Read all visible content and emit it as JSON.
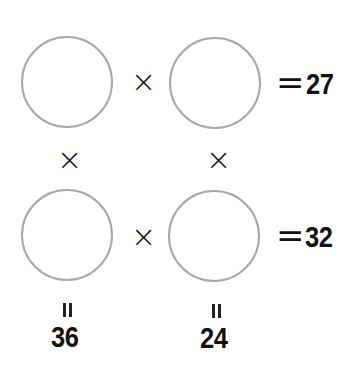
{
  "puzzle": {
    "operator": "×",
    "equals": "=",
    "rows": [
      {
        "result": "27"
      },
      {
        "result": "32"
      }
    ],
    "columns": [
      {
        "result": "36"
      },
      {
        "result": "24"
      }
    ],
    "cells": [
      {
        "row": 1,
        "col": 1,
        "value": ""
      },
      {
        "row": 1,
        "col": 2,
        "value": ""
      },
      {
        "row": 2,
        "col": 1,
        "value": ""
      },
      {
        "row": 2,
        "col": 2,
        "value": ""
      }
    ]
  }
}
